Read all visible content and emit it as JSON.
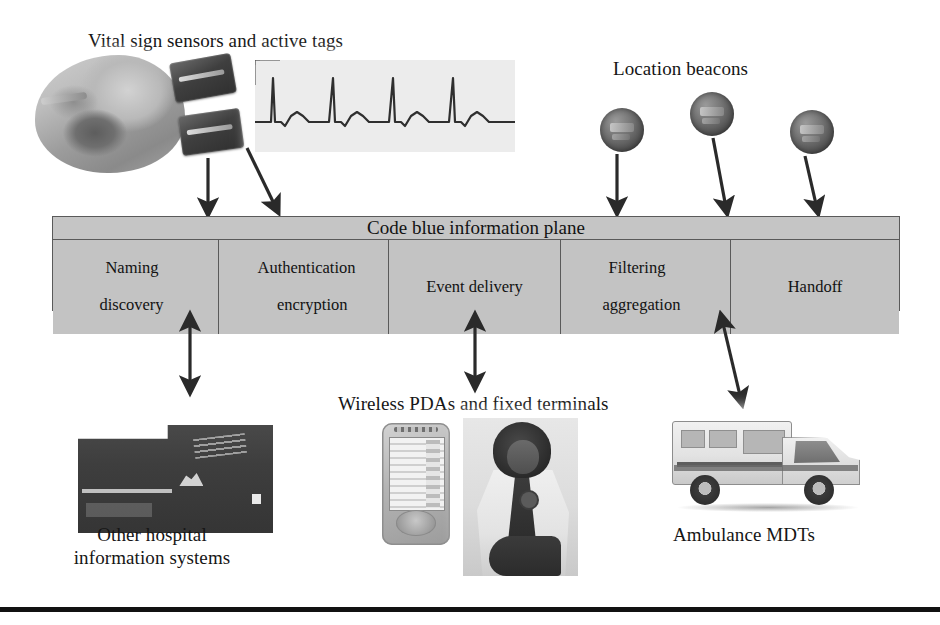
{
  "figure": {
    "background_color": "#ffffff",
    "bar_fill_color": "#c3c3c3",
    "bar_border_color": "#5a5a5a",
    "arrow_color": "#2a2a2a",
    "rule_color": "#111111"
  },
  "captions": {
    "top_left": "Vital sign sensors and active tags",
    "top_right": "Location beacons",
    "bottom_left": "Other hospital\ninformation systems",
    "bottom_center": "Wireless PDAs and fixed terminals",
    "bottom_right": "Ambulance MDTs"
  },
  "plane": {
    "title": "Code blue information plane",
    "services": [
      {
        "line1": "Naming",
        "line2": "discovery",
        "single": false
      },
      {
        "line1": "Authentication",
        "line2": "encryption",
        "single": false
      },
      {
        "line1": "Event delivery",
        "line2": "",
        "single": true
      },
      {
        "line1": "Filtering",
        "line2": "aggregation",
        "single": false
      },
      {
        "line1": "Handoff",
        "line2": "",
        "single": true
      }
    ]
  },
  "images": {
    "patient_photo": "patient-with-vital-sign-sensors-photo",
    "sensor_tag_upper": "active-tag-device-photo",
    "sensor_tag_lower": "active-tag-device-photo",
    "ecg_strip": "ecg-waveform-strip",
    "beacons": [
      "location-beacon-photo",
      "location-beacon-photo",
      "location-beacon-photo"
    ],
    "hospital": "hospital-building-photo",
    "pda": "wireless-pda-device-photo",
    "clinician": "clinician-with-stethoscope-photo",
    "ambulance": "ambulance-vehicle-photo"
  },
  "arrows": {
    "downward": [
      {
        "from": "sensor-tag-lower",
        "to": "information-plane"
      },
      {
        "from": "ecg-monitor",
        "to": "information-plane"
      },
      {
        "from": "location-beacon-1",
        "to": "information-plane"
      },
      {
        "from": "location-beacon-2",
        "to": "information-plane"
      },
      {
        "from": "location-beacon-3",
        "to": "information-plane"
      }
    ],
    "bidirectional": [
      {
        "between": "information-plane",
        "and": "other-hospital-information-systems"
      },
      {
        "between": "information-plane",
        "and": "wireless-pdas-and-fixed-terminals"
      },
      {
        "between": "information-plane",
        "and": "ambulance-mdts"
      }
    ]
  }
}
